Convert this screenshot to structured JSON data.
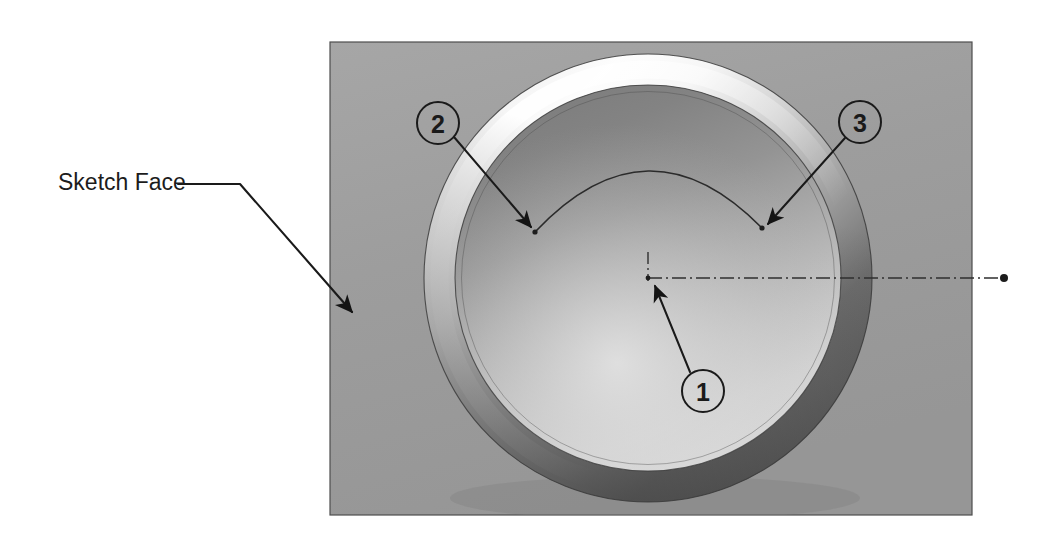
{
  "figure": {
    "type": "cad-3d-illustration",
    "background_color": "#ffffff",
    "panel": {
      "label": "Sketch Face",
      "fill_color": "#9e9e9e",
      "edge_color": "#4a4a4a",
      "x": 330,
      "y": 42,
      "width": 642,
      "height": 473
    },
    "ring": {
      "name": "torus-ring",
      "center_x": 648,
      "center_y": 278,
      "outer_radius": 224,
      "inner_radius": 193,
      "highlight_color": "#fbfbfb",
      "shadow_color": "#5a5a5a",
      "face_light_color": "#d8d8d8",
      "face_dark_color": "#7d7d7d"
    },
    "sketch_arc": {
      "name": "sketch-arc",
      "start_x": 535,
      "start_y": 232,
      "end_x": 762,
      "end_y": 228,
      "apex_x": 648,
      "apex_y": 155,
      "stroke_color": "#2b2b2b"
    },
    "centerline": {
      "name": "horizontal-centerline",
      "style": "dash-dot",
      "from_x": 648,
      "from_y": 278,
      "to_x": 1004,
      "to_y": 278,
      "stroke_color": "#2f2f2f",
      "endpoint_dot_radius": 4
    },
    "vertical_centerline": {
      "name": "vertical-centerline",
      "style": "dash-dot",
      "from_x": 648,
      "from_y": 255,
      "to_x": 648,
      "to_y": 281,
      "stroke_color": "#2f2f2f"
    }
  },
  "leader_label": {
    "name": "sketch-face-leader",
    "text": "Sketch Face",
    "text_x": 58,
    "text_y": 182,
    "shelf_start_x": 178,
    "shelf_end_x": 240,
    "shelf_y": 184,
    "arrow_tip_x": 356,
    "arrow_tip_y": 316,
    "stroke_color": "#1a1a1a"
  },
  "callouts": [
    {
      "id": "callout-1",
      "label": "1",
      "circle_x": 703,
      "circle_y": 391,
      "radius": 21,
      "leader_from_x": 690,
      "leader_from_y": 372,
      "arrow_tip_x": 651,
      "arrow_tip_y": 281,
      "points_to": "arc-center-point",
      "stroke_color": "#1a1a1a",
      "fill_color": "none"
    },
    {
      "id": "callout-2",
      "label": "2",
      "circle_x": 438,
      "circle_y": 123,
      "radius": 21,
      "leader_from_x": 454,
      "leader_from_y": 137,
      "arrow_tip_x": 536,
      "arrow_tip_y": 233,
      "points_to": "arc-endpoint-left",
      "stroke_color": "#1a1a1a",
      "fill_color": "none"
    },
    {
      "id": "callout-3",
      "label": "3",
      "circle_x": 860,
      "circle_y": 122,
      "radius": 21,
      "leader_from_x": 845,
      "leader_from_y": 138,
      "arrow_tip_x": 763,
      "arrow_tip_y": 229,
      "points_to": "arc-endpoint-right",
      "stroke_color": "#1a1a1a",
      "fill_color": "none"
    }
  ]
}
